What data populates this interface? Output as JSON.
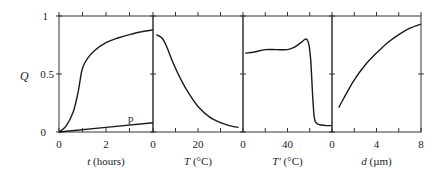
{
  "chart_data": [
    {
      "type": "line",
      "panel": 1,
      "xlabel": "t (hours)",
      "xlabel_italic": "t",
      "xlabel_unit": " (hours)",
      "ylabel": "Q",
      "xlim": [
        0,
        4
      ],
      "ylim": [
        0,
        1
      ],
      "x_tick_labels": [
        {
          "value": 0,
          "label": "0"
        },
        {
          "value": 2,
          "label": "2"
        }
      ],
      "x_minor_ticks": [
        1,
        3
      ],
      "y_tick_labels": [
        {
          "value": 0,
          "label": "0"
        },
        {
          "value": 0.5,
          "label": "0.5"
        },
        {
          "value": 1,
          "label": "1"
        }
      ],
      "series": [
        {
          "name": "main",
          "x": [
            0,
            0.3,
            0.6,
            0.8,
            0.9,
            1.0,
            1.2,
            1.5,
            2.0,
            2.5,
            3.0,
            3.5,
            4.0
          ],
          "y": [
            0,
            0.05,
            0.17,
            0.33,
            0.45,
            0.55,
            0.63,
            0.7,
            0.77,
            0.81,
            0.84,
            0.865,
            0.88
          ]
        },
        {
          "name": "p",
          "x": [
            0,
            4
          ],
          "y": [
            0,
            0.08
          ]
        }
      ],
      "annotations": [
        {
          "text": "p",
          "x": 3.0,
          "y": 0.1
        }
      ]
    },
    {
      "type": "line",
      "panel": 2,
      "xlabel": "T (°C)",
      "xlabel_italic": "T",
      "xlabel_unit": " (°C)",
      "xlim": [
        0,
        40
      ],
      "ylim": [
        0,
        1
      ],
      "x_tick_labels": [
        {
          "value": 0,
          "label": "0"
        },
        {
          "value": 20,
          "label": "20"
        }
      ],
      "x_minor_ticks": [
        10,
        30
      ],
      "series": [
        {
          "name": "main",
          "x": [
            1.5,
            4,
            6,
            8,
            10,
            13,
            16,
            20,
            25,
            30,
            34,
            38
          ],
          "y": [
            0.84,
            0.81,
            0.74,
            0.64,
            0.55,
            0.43,
            0.33,
            0.22,
            0.13,
            0.08,
            0.055,
            0.04
          ]
        }
      ]
    },
    {
      "type": "line",
      "panel": 3,
      "xlabel": "T' (°C)",
      "xlabel_italic": "T'",
      "xlabel_unit": " (°C)",
      "xlim": [
        0,
        80
      ],
      "ylim": [
        0,
        1
      ],
      "x_tick_labels": [
        {
          "value": 0,
          "label": "0"
        },
        {
          "value": 40,
          "label": "40"
        }
      ],
      "x_minor_ticks": [
        20,
        60
      ],
      "series": [
        {
          "name": "main",
          "x": [
            2,
            10,
            20,
            30,
            40,
            46,
            52,
            56,
            58,
            59.5,
            61,
            62,
            63,
            64,
            65,
            67,
            70,
            75,
            80
          ],
          "y": [
            0.68,
            0.69,
            0.71,
            0.71,
            0.71,
            0.73,
            0.77,
            0.8,
            0.79,
            0.74,
            0.6,
            0.42,
            0.25,
            0.13,
            0.09,
            0.07,
            0.06,
            0.055,
            0.055
          ]
        }
      ]
    },
    {
      "type": "line",
      "panel": 4,
      "xlabel": "d (µm)",
      "xlabel_italic": "d",
      "xlabel_unit": " (µm)",
      "xlim": [
        0,
        8
      ],
      "ylim": [
        0,
        1
      ],
      "x_tick_labels": [
        {
          "value": 0,
          "label": "0"
        },
        {
          "value": 4,
          "label": "4"
        },
        {
          "value": 8,
          "label": "8"
        }
      ],
      "x_minor_ticks": [
        2,
        6
      ],
      "series": [
        {
          "name": "main",
          "x": [
            0.6,
            1,
            2,
            3,
            4,
            5,
            6,
            7,
            8
          ],
          "y": [
            0.21,
            0.28,
            0.45,
            0.58,
            0.68,
            0.77,
            0.84,
            0.895,
            0.93
          ]
        }
      ]
    }
  ],
  "labels": {
    "y_axis": "Q",
    "y_ticks": [
      "0",
      "0.5",
      "1"
    ],
    "annotation_p": "p"
  },
  "style": {
    "line_color": "#1a1a1a",
    "axis_color": "#333333",
    "text_color": "#222222"
  }
}
